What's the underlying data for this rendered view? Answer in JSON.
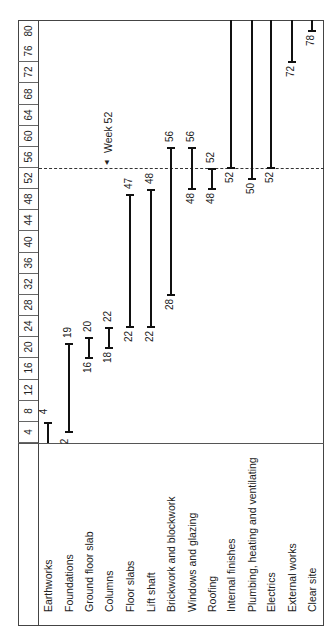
{
  "chart_data": {
    "type": "gantt",
    "orientation": "rotated 90deg counter-clockwise (time runs bottom-to-top)",
    "title": "",
    "xlabel": "Week",
    "time_axis_ticks": [
      4,
      8,
      12,
      16,
      20,
      24,
      28,
      32,
      36,
      40,
      44,
      48,
      52,
      56,
      60,
      64,
      68,
      72,
      76,
      80
    ],
    "time_range": [
      0,
      80
    ],
    "tasks": [
      {
        "name": "Earthworks",
        "start": 0,
        "end": 4,
        "start_label": "",
        "end_label": "4"
      },
      {
        "name": "Foundations",
        "start": 2,
        "end": 19,
        "start_label": "2",
        "end_label": "19"
      },
      {
        "name": "Ground floor slab",
        "start": 16,
        "end": 20,
        "start_label": "16",
        "end_label": "20"
      },
      {
        "name": "Columns",
        "start": 18,
        "end": 22,
        "start_label": "18",
        "end_label": "22"
      },
      {
        "name": "Floor slabs",
        "start": 22,
        "end": 47,
        "start_label": "22",
        "end_label": "47"
      },
      {
        "name": "Lift shaft",
        "start": 22,
        "end": 48,
        "start_label": "22",
        "end_label": "48"
      },
      {
        "name": "Brickwork and blockwork",
        "start": 28,
        "end": 56,
        "start_label": "28",
        "end_label": "56"
      },
      {
        "name": "Windows and glazing",
        "start": 48,
        "end": 56,
        "start_label": "48",
        "end_label": "56"
      },
      {
        "name": "Roofing",
        "start": 48,
        "end": 52,
        "start_label": "48",
        "end_label": "52"
      },
      {
        "name": "Internal finishes",
        "start": 52,
        "end": 80,
        "start_label": "52",
        "end_label": ""
      },
      {
        "name": "Plumbing, heating and ventilating",
        "start": 50,
        "end": 80,
        "start_label": "50",
        "end_label": ""
      },
      {
        "name": "Electrics",
        "start": 52,
        "end": 80,
        "start_label": "52",
        "end_label": ""
      },
      {
        "name": "External works",
        "start": 72,
        "end": 80,
        "start_label": "72",
        "end_label": ""
      },
      {
        "name": "Clear site",
        "start": 78,
        "end": 80,
        "start_label": "78",
        "end_label": ""
      }
    ],
    "annotations": [
      {
        "type": "dashed-line",
        "at_week": 52,
        "label": "Week 52",
        "marker": "▼"
      }
    ],
    "grid": false,
    "legend": null
  }
}
